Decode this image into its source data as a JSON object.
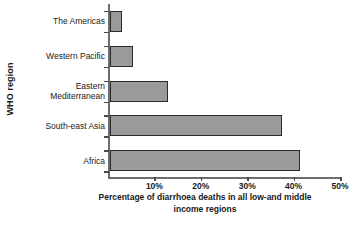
{
  "chart_data": {
    "type": "bar",
    "orientation": "horizontal",
    "title": "",
    "xlabel": "Percentage of diarrhoea deaths in all low-and middle income regions",
    "xlabel_lines": [
      "Percentage of diarrhoea deaths in all low-and middle",
      "income regions"
    ],
    "ylabel": "WHO region",
    "categories": [
      "The Americas",
      "Western Pacific",
      "Eastern Mediterranean",
      "South-east Asia",
      "Africa"
    ],
    "category_label_lines": [
      [
        "The Americas"
      ],
      [
        "Western Pacific"
      ],
      [
        "Eastern",
        "Mediterranean"
      ],
      [
        "South-east Asia"
      ],
      [
        "Africa"
      ]
    ],
    "values": [
      2.5,
      5,
      12.5,
      37,
      41
    ],
    "value_unit": "%",
    "xlim": [
      0,
      50
    ],
    "xticks": [
      0,
      10,
      20,
      30,
      40,
      50
    ],
    "xtick_labels": [
      "",
      "10%",
      "20%",
      "30%",
      "40%",
      "50%"
    ],
    "grid": false,
    "legend": false,
    "legend_position": "none",
    "colors": {
      "bar_fill": "#9a9a9a",
      "bar_border": "#2b2b2b",
      "axis": "#6d6d6d",
      "text": "#1a1a1a",
      "background": "#ffffff"
    }
  }
}
